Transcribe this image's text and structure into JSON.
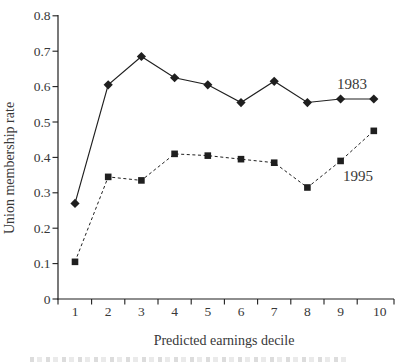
{
  "figure": {
    "background_color": "#ffffff",
    "ink_color": "#1f1f1f",
    "text_color": "#383838"
  },
  "chart_data": {
    "type": "line",
    "title": "",
    "xlabel": "Predicted earnings decile",
    "ylabel": "Union membership rate",
    "x": [
      1,
      2,
      3,
      4,
      5,
      6,
      7,
      8,
      9,
      10
    ],
    "x_tick_labels": [
      "1",
      "2",
      "3",
      "4",
      "5",
      "6",
      "7",
      "8",
      "9",
      "10"
    ],
    "y_ticks": [
      0,
      0.1,
      0.2,
      0.3,
      0.4,
      0.5,
      0.6,
      0.7,
      0.8
    ],
    "y_tick_labels": [
      "0",
      "0.1",
      "0.2",
      "0.3",
      "0.4",
      "0.5",
      "0.6",
      "0.7",
      "0.8"
    ],
    "ylim": [
      0,
      0.8
    ],
    "grid": false,
    "legend": "inline-labels-right-of-lines",
    "series": [
      {
        "name": "1983",
        "marker": "diamond",
        "line_style": "solid",
        "values": [
          0.27,
          0.605,
          0.685,
          0.625,
          0.605,
          0.555,
          0.615,
          0.555,
          0.565,
          0.565
        ]
      },
      {
        "name": "1995",
        "marker": "square",
        "line_style": "dashed",
        "values": [
          0.105,
          0.345,
          0.335,
          0.41,
          0.405,
          0.395,
          0.385,
          0.315,
          0.39,
          0.475
        ]
      }
    ]
  }
}
